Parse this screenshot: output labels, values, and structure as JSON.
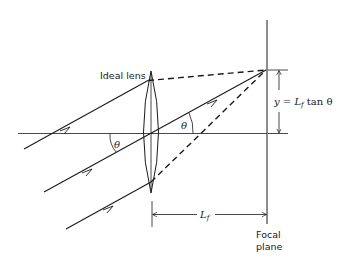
{
  "diagram": {
    "type": "optics-ray-diagram",
    "labels": {
      "lens": "Ideal lens",
      "angle_symbol": "θ",
      "focal_length": "L",
      "focal_length_subscript": "f",
      "height_eq_prefix": "y = ",
      "height_eq_L": "L",
      "height_eq_sub": "f",
      "height_eq_suffix": " tan θ",
      "focal_plane_line1": "Focal",
      "focal_plane_line2": "plane"
    },
    "elements": {
      "optical_axis": "horizontal line",
      "lens": "biconvex ideal lens",
      "rays": [
        "top ray (solid then dashed)",
        "chief ray (solid through center)",
        "bottom ray (solid then dashed)"
      ],
      "focal_plane": "vertical line",
      "dimensions": [
        "y = Lf tan θ",
        "Lf"
      ]
    },
    "colors": {
      "ink": "#1a1a1a",
      "background": "#ffffff"
    }
  }
}
